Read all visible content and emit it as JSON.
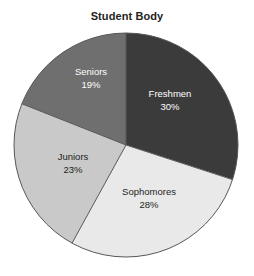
{
  "chart_data": {
    "type": "pie",
    "title": "Student Body",
    "xlabel": "",
    "ylabel": "",
    "legend": "none",
    "grid": false,
    "start_angle_deg": 0,
    "direction": "clockwise",
    "categories": [
      "Freshmen",
      "Sophomores",
      "Juniors",
      "Seniors"
    ],
    "values": [
      30,
      28,
      23,
      19
    ],
    "value_suffix": "%",
    "slices": [
      {
        "label": "Freshmen",
        "value": 30,
        "value_text": "30%",
        "color": "#3b3b3b",
        "text_color": "#ffffff",
        "label_x": 170,
        "label_y": 97,
        "value_x": 170,
        "value_y": 110
      },
      {
        "label": "Sophomores",
        "value": 28,
        "value_text": "28%",
        "color": "#e9e9e9",
        "text_color": "#231f20",
        "label_x": 149,
        "label_y": 195,
        "value_x": 149,
        "value_y": 208
      },
      {
        "label": "Juniors",
        "value": 23,
        "value_text": "23%",
        "color": "#c9c9c9",
        "text_color": "#231f20",
        "label_x": 73,
        "label_y": 160,
        "value_x": 73,
        "value_y": 173
      },
      {
        "label": "Seniors",
        "value": 19,
        "value_text": "19%",
        "color": "#6f6f6f",
        "text_color": "#ffffff",
        "label_x": 91,
        "label_y": 75,
        "value_x": 91,
        "value_y": 88
      }
    ],
    "geometry": {
      "center_x": 126,
      "center_y": 145,
      "radius": 112
    },
    "outline_color": "#58585a",
    "background": "#ffffff"
  }
}
